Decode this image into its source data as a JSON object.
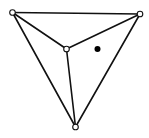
{
  "diagram": {
    "vertices": [
      {
        "id": "top-left",
        "style": "hollow"
      },
      {
        "id": "top-right",
        "style": "hollow"
      },
      {
        "id": "center",
        "style": "hollow"
      },
      {
        "id": "bottom",
        "style": "hollow"
      }
    ],
    "edges": [
      {
        "from": "top-left",
        "to": "top-right"
      },
      {
        "from": "top-left",
        "to": "bottom"
      },
      {
        "from": "top-right",
        "to": "bottom"
      },
      {
        "from": "top-left",
        "to": "center"
      },
      {
        "from": "top-right",
        "to": "center"
      },
      {
        "from": "center",
        "to": "bottom"
      }
    ],
    "points": [
      {
        "id": "query-point",
        "style": "filled",
        "region": "triangle center–top-right–bottom"
      }
    ],
    "colors": {
      "stroke": "#111111",
      "vertex_fill": "#ffffff",
      "point_fill": "#000000"
    }
  }
}
